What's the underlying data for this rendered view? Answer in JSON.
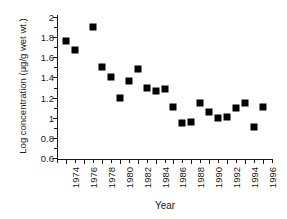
{
  "chart_data": {
    "type": "scatter",
    "title": "",
    "xlabel": "Year",
    "ylabel": "Log concentration (µg/g wet wt.)",
    "xlim": [
      1973,
      1997
    ],
    "ylim": [
      0.6,
      2.0
    ],
    "grid": false,
    "legend": null,
    "marker": "filled-square",
    "marker_color": "#000000",
    "x_tick_labels": [
      "1974",
      "1976",
      "1978",
      "1980",
      "1982",
      "1984",
      "1986",
      "1988",
      "1990",
      "1992",
      "1994",
      "1996"
    ],
    "x_tick_values": [
      1974,
      1976,
      1978,
      1980,
      1982,
      1984,
      1986,
      1988,
      1990,
      1992,
      1994,
      1996
    ],
    "x_minor_tick_values": [
      1973,
      1975,
      1977,
      1979,
      1981,
      1983,
      1985,
      1987,
      1989,
      1991,
      1993,
      1995,
      1997
    ],
    "y_tick_labels": [
      "2",
      "1.8",
      "1.6",
      "1.4",
      "1.2",
      "1",
      "0.8",
      "0.6"
    ],
    "y_tick_values": [
      2.0,
      1.8,
      1.6,
      1.4,
      1.2,
      1.0,
      0.8,
      0.6
    ],
    "y_minor_tick_values": [
      1.9,
      1.7,
      1.5,
      1.3,
      1.1,
      0.9,
      0.7
    ],
    "x": [
      1974,
      1975,
      1977,
      1978,
      1979,
      1980,
      1981,
      1982,
      1983,
      1984,
      1985,
      1986,
      1987,
      1988,
      1989,
      1990,
      1991,
      1992,
      1993,
      1994,
      1995,
      1996
    ],
    "values": [
      1.76,
      1.67,
      1.9,
      1.5,
      1.4,
      1.2,
      1.36,
      1.48,
      1.3,
      1.27,
      1.29,
      1.11,
      0.95,
      0.96,
      1.15,
      1.06,
      1.0,
      1.01,
      1.1,
      1.15,
      0.91,
      1.11
    ],
    "points": [
      {
        "x": 1974,
        "y": 1.76
      },
      {
        "x": 1975,
        "y": 1.67
      },
      {
        "x": 1977,
        "y": 1.9
      },
      {
        "x": 1978,
        "y": 1.5
      },
      {
        "x": 1979,
        "y": 1.4
      },
      {
        "x": 1980,
        "y": 1.2
      },
      {
        "x": 1981,
        "y": 1.36
      },
      {
        "x": 1982,
        "y": 1.48
      },
      {
        "x": 1983,
        "y": 1.3
      },
      {
        "x": 1984,
        "y": 1.27
      },
      {
        "x": 1985,
        "y": 1.29
      },
      {
        "x": 1986,
        "y": 1.11
      },
      {
        "x": 1987,
        "y": 0.95
      },
      {
        "x": 1988,
        "y": 0.96
      },
      {
        "x": 1989,
        "y": 1.15
      },
      {
        "x": 1990,
        "y": 1.06
      },
      {
        "x": 1991,
        "y": 1.0
      },
      {
        "x": 1992,
        "y": 1.01
      },
      {
        "x": 1993,
        "y": 1.1
      },
      {
        "x": 1994,
        "y": 1.15
      },
      {
        "x": 1995,
        "y": 0.91
      },
      {
        "x": 1996,
        "y": 1.11
      }
    ]
  }
}
